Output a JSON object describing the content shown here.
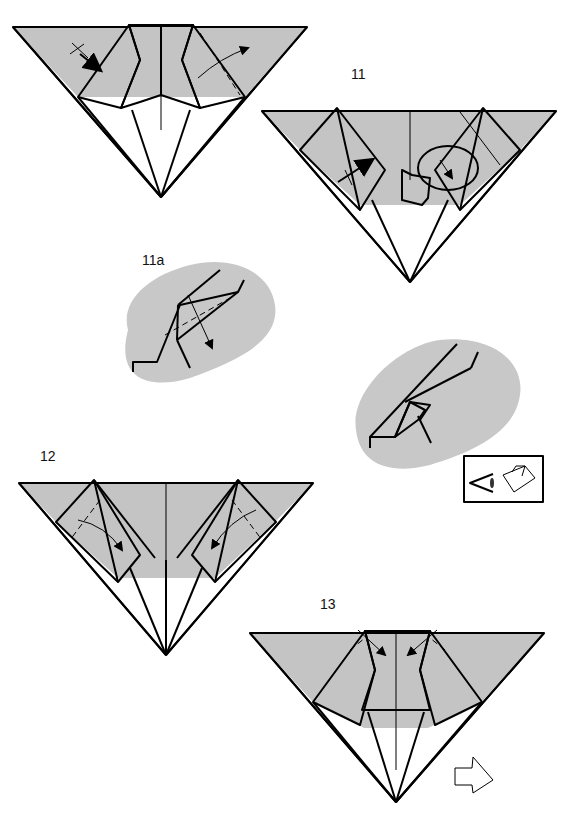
{
  "steps": [
    {
      "id": "10",
      "label": "",
      "note": "partial step at top (label cut off)"
    },
    {
      "id": "11",
      "label": "11"
    },
    {
      "id": "11a",
      "label": "11a"
    },
    {
      "id": "11b",
      "label": ""
    },
    {
      "id": "12",
      "label": "12"
    },
    {
      "id": "13",
      "label": "13"
    }
  ],
  "colors": {
    "paper_colored_side": "#c4c4c4",
    "paper_white_side": "#ffffff",
    "line": "#000000",
    "detail_background": "#c8c8c8"
  },
  "symbols": {
    "valley_fold_arrow": "arrow-icon",
    "repeat_marker": "cross-tick-icon",
    "push_arrow": "push-arrow-icon",
    "turn_over": "turn-over-arrow-icon",
    "view_from_eye": "eye-icon"
  }
}
